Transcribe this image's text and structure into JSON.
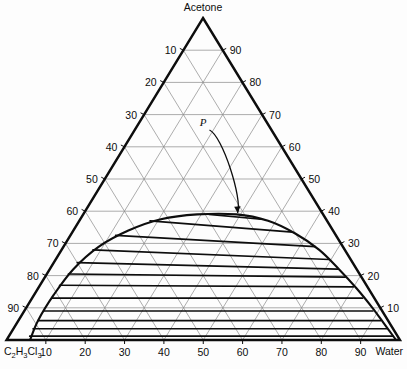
{
  "figure": {
    "kind": "ternary-phase-diagram",
    "background_color": "#fdfdfd",
    "line_color": "#0d0d0d",
    "grid_color": "#8a8a8a",
    "title": ""
  },
  "vertices": {
    "top": {
      "label": "Acetone",
      "name": "acetone-vertex-label"
    },
    "bottom_left": {
      "label": "C2H3Cl3",
      "label_parts": [
        {
          "text": "C",
          "sub": false
        },
        {
          "text": "2",
          "sub": true
        },
        {
          "text": "H",
          "sub": false
        },
        {
          "text": "3",
          "sub": true
        },
        {
          "text": "Cl",
          "sub": false
        },
        {
          "text": "3",
          "sub": true
        }
      ]
    },
    "bottom_right": {
      "label": "Water"
    }
  },
  "axes": {
    "bottom": {
      "name": "water-axis",
      "ticks": [
        "10",
        "20",
        "30",
        "40",
        "50",
        "60",
        "70",
        "80",
        "90"
      ]
    },
    "left": {
      "name": "acetone-left-axis",
      "ticks": [
        "10",
        "20",
        "30",
        "40",
        "50",
        "60",
        "70",
        "80",
        "90"
      ]
    },
    "right": {
      "name": "right-axis",
      "ticks": [
        "90",
        "80",
        "70",
        "60",
        "50",
        "40",
        "30",
        "20",
        "10"
      ]
    }
  },
  "annotations": [
    {
      "label": "P",
      "meaning": "plait-point",
      "name": "plait-point-annotation"
    }
  ],
  "chart_data": {
    "type": "scatter",
    "title": "",
    "subtitle": "",
    "xlabel": "",
    "ylabel": "",
    "grid": true,
    "legend_position": "none",
    "components": [
      "C2H3Cl3",
      "Acetone",
      "Water"
    ],
    "tick_interval": 10,
    "axis_range": [
      0,
      100
    ],
    "annotations": [
      {
        "text": "P",
        "component_pct": {
          "C2H3Cl3": 22,
          "Acetone": 39,
          "Water": 39
        }
      }
    ],
    "binodal_curve": {
      "name": "solubility-envelope",
      "points_pct": [
        {
          "C2H3Cl3": 94.0,
          "Acetone": 0.0,
          "Water": 6.0
        },
        {
          "C2H3Cl3": 89.0,
          "Acetone": 6.0,
          "Water": 5.0
        },
        {
          "C2H3Cl3": 81.0,
          "Acetone": 14.0,
          "Water": 5.0
        },
        {
          "C2H3Cl3": 72.0,
          "Acetone": 22.0,
          "Water": 6.0
        },
        {
          "C2H3Cl3": 62.0,
          "Acetone": 29.0,
          "Water": 9.0
        },
        {
          "C2H3Cl3": 52.0,
          "Acetone": 34.0,
          "Water": 14.0
        },
        {
          "C2H3Cl3": 42.0,
          "Acetone": 37.5,
          "Water": 20.5
        },
        {
          "C2H3Cl3": 32.0,
          "Acetone": 39.0,
          "Water": 29.0
        },
        {
          "C2H3Cl3": 22.0,
          "Acetone": 39.0,
          "Water": 39.0
        },
        {
          "C2H3Cl3": 15.0,
          "Acetone": 37.0,
          "Water": 48.0
        },
        {
          "C2H3Cl3": 10.0,
          "Acetone": 33.0,
          "Water": 57.0
        },
        {
          "C2H3Cl3": 6.5,
          "Acetone": 28.0,
          "Water": 65.5
        },
        {
          "C2H3Cl3": 4.5,
          "Acetone": 22.0,
          "Water": 73.5
        },
        {
          "C2H3Cl3": 3.0,
          "Acetone": 16.0,
          "Water": 81.0
        },
        {
          "C2H3Cl3": 2.0,
          "Acetone": 10.0,
          "Water": 88.0
        },
        {
          "C2H3Cl3": 1.5,
          "Acetone": 5.0,
          "Water": 93.5
        },
        {
          "C2H3Cl3": 1.0,
          "Acetone": 0.0,
          "Water": 99.0
        }
      ]
    },
    "tie_lines": {
      "name": "tie-lines",
      "count": 12,
      "lines_pct": [
        {
          "raffinate": {
            "C2H3Cl3": 29.0,
            "Acetone": 39.0,
            "Water": 32.0
          },
          "extract": {
            "C2H3Cl3": 16.5,
            "Acetone": 37.5,
            "Water": 46.0
          }
        },
        {
          "raffinate": {
            "C2H3Cl3": 45.0,
            "Acetone": 37.0,
            "Water": 18.0
          },
          "extract": {
            "C2H3Cl3": 10.5,
            "Acetone": 33.5,
            "Water": 56.0
          }
        },
        {
          "raffinate": {
            "C2H3Cl3": 56.0,
            "Acetone": 32.5,
            "Water": 11.5
          },
          "extract": {
            "C2H3Cl3": 7.0,
            "Acetone": 29.0,
            "Water": 64.0
          }
        },
        {
          "raffinate": {
            "C2H3Cl3": 64.0,
            "Acetone": 28.0,
            "Water": 8.0
          },
          "extract": {
            "C2H3Cl3": 5.5,
            "Acetone": 25.0,
            "Water": 69.5
          }
        },
        {
          "raffinate": {
            "C2H3Cl3": 70.0,
            "Acetone": 24.0,
            "Water": 6.0
          },
          "extract": {
            "C2H3Cl3": 4.8,
            "Acetone": 22.0,
            "Water": 73.2
          }
        },
        {
          "raffinate": {
            "C2H3Cl3": 74.0,
            "Acetone": 20.5,
            "Water": 5.5
          },
          "extract": {
            "C2H3Cl3": 4.2,
            "Acetone": 19.5,
            "Water": 76.3
          }
        },
        {
          "raffinate": {
            "C2H3Cl3": 78.0,
            "Acetone": 17.0,
            "Water": 5.0
          },
          "extract": {
            "C2H3Cl3": 3.6,
            "Acetone": 16.5,
            "Water": 79.9
          }
        },
        {
          "raffinate": {
            "C2H3Cl3": 82.0,
            "Acetone": 13.0,
            "Water": 5.0
          },
          "extract": {
            "C2H3Cl3": 3.0,
            "Acetone": 13.0,
            "Water": 84.0
          }
        },
        {
          "raffinate": {
            "C2H3Cl3": 86.0,
            "Acetone": 9.0,
            "Water": 5.0
          },
          "extract": {
            "C2H3Cl3": 2.4,
            "Acetone": 9.0,
            "Water": 88.6
          }
        },
        {
          "raffinate": {
            "C2H3Cl3": 89.0,
            "Acetone": 6.0,
            "Water": 5.0
          },
          "extract": {
            "C2H3Cl3": 2.0,
            "Acetone": 6.0,
            "Water": 92.0
          }
        },
        {
          "raffinate": {
            "C2H3Cl3": 91.5,
            "Acetone": 3.5,
            "Water": 5.0
          },
          "extract": {
            "C2H3Cl3": 1.6,
            "Acetone": 3.5,
            "Water": 94.9
          }
        },
        {
          "raffinate": {
            "C2H3Cl3": 93.5,
            "Acetone": 1.2,
            "Water": 5.3
          },
          "extract": {
            "C2H3Cl3": 1.2,
            "Acetone": 1.2,
            "Water": 97.6
          }
        }
      ]
    }
  }
}
